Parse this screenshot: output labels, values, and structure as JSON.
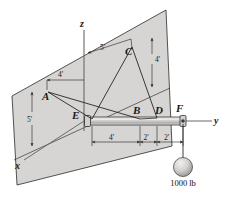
{
  "figure": {
    "kind": "engineering-statics-free-body-diagram",
    "background_color": "#ffffff",
    "plane_fill": "#d6d5d3",
    "plane_stroke": "#2b2b2b",
    "shaft_fill": "#c9c8c6",
    "sphere_fill": "#cfcecc",
    "ink_color": "#1a1a1a"
  },
  "axes": [
    {
      "name": "z-axis",
      "label": "z"
    },
    {
      "name": "y-axis",
      "label": "y"
    },
    {
      "name": "x-axis",
      "label": "x"
    }
  ],
  "points": [
    {
      "name": "point-a",
      "label": "A"
    },
    {
      "name": "point-b",
      "label": "B"
    },
    {
      "name": "point-c",
      "label": "C"
    },
    {
      "name": "point-d",
      "label": "D"
    },
    {
      "name": "point-e",
      "label": "E"
    },
    {
      "name": "point-f",
      "label": "F"
    }
  ],
  "dimensions": [
    {
      "name": "dim-cable-a-horizontal",
      "label": "4'"
    },
    {
      "name": "dim-cable-c-horizontal",
      "label": "5'"
    },
    {
      "name": "dim-a-vertical",
      "label": "5'"
    },
    {
      "name": "dim-c-vertical",
      "label": "4'"
    },
    {
      "name": "dim-e-to-b",
      "label": "4'"
    },
    {
      "name": "dim-b-to-d",
      "label": "2'"
    },
    {
      "name": "dim-d-to-f",
      "label": "2'"
    }
  ],
  "load": {
    "name": "hanging-weight",
    "label": "1000 lb",
    "magnitude": 1000,
    "unit": "lb"
  }
}
